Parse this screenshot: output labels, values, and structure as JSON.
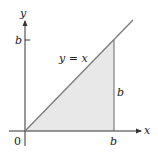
{
  "diagram": {
    "axes": {
      "x_label": "x",
      "y_label": "y",
      "origin_label": "0"
    },
    "x_tick_label": "b",
    "y_tick_label": "b",
    "line_label": "y = x",
    "side_label": "b",
    "region": "triangle under y = x from x = 0 to x = b",
    "colors": {
      "fill": "#e8e8e8",
      "line": "#7a7a7a",
      "axis": "#333333"
    }
  }
}
